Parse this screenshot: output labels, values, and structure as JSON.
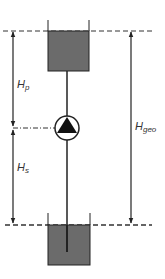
{
  "diagram": {
    "type": "pump-system-head",
    "labels": {
      "pressure_head": "H",
      "pressure_head_sub": "p",
      "suction_head": "H",
      "suction_head_sub": "s",
      "geodetic_head": "H",
      "geodetic_head_sub": "geo"
    },
    "colors": {
      "tank_fill": "#6b6b6b",
      "line": "#222222",
      "background": "#ffffff"
    },
    "components": [
      "upper-tank",
      "pump",
      "lower-tank",
      "pipe"
    ]
  }
}
